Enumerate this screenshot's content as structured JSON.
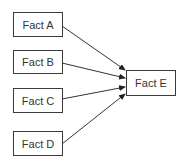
{
  "diagram": {
    "nodes": [
      {
        "id": "A",
        "label": "Fact A"
      },
      {
        "id": "B",
        "label": "Fact B"
      },
      {
        "id": "C",
        "label": "Fact C"
      },
      {
        "id": "D",
        "label": "Fact D"
      },
      {
        "id": "E",
        "label": "Fact E"
      }
    ],
    "edges": [
      {
        "from": "A",
        "to": "E"
      },
      {
        "from": "B",
        "to": "E"
      },
      {
        "from": "C",
        "to": "E"
      },
      {
        "from": "D",
        "to": "E"
      }
    ]
  }
}
